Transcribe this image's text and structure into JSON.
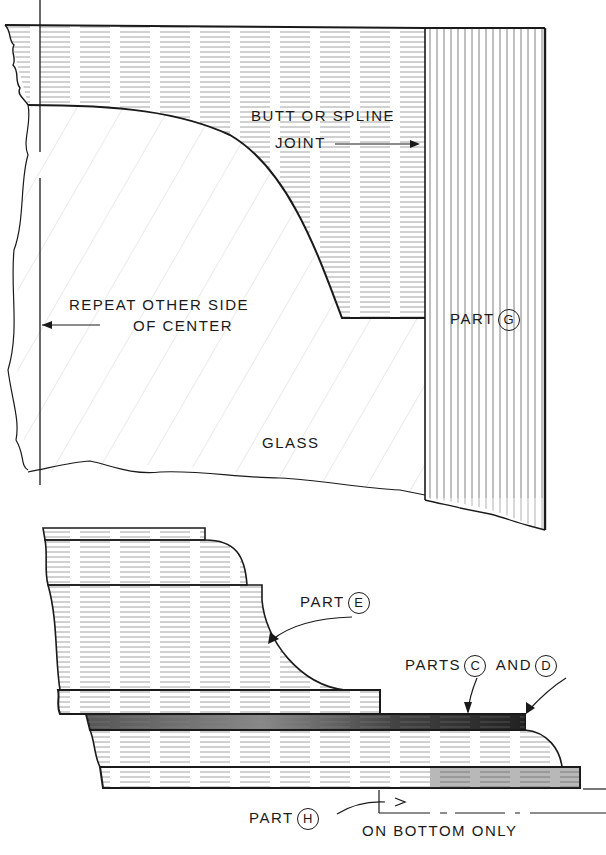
{
  "figure": {
    "colors": {
      "ink": "#1a1a1a",
      "background": "#ffffff",
      "hatch": "#9a9a9a"
    }
  },
  "upper_view": {
    "labels": {
      "joint_line1": "BUTT OR SPLINE",
      "joint_line2": "JOINT",
      "repeat_line1": "REPEAT OTHER SIDE",
      "repeat_line2": "OF CENTER",
      "glass": "GLASS",
      "part_g_prefix": "PART",
      "part_g_letter": "G"
    }
  },
  "lower_view": {
    "labels": {
      "part_e_prefix": "PART",
      "part_e_letter": "E",
      "parts_cd_prefix": "PARTS",
      "part_c_letter": "C",
      "and": "AND",
      "part_d_letter": "D",
      "part_h_prefix": "PART",
      "part_h_letter": "H",
      "bottom_note": "ON BOTTOM ONLY"
    }
  }
}
